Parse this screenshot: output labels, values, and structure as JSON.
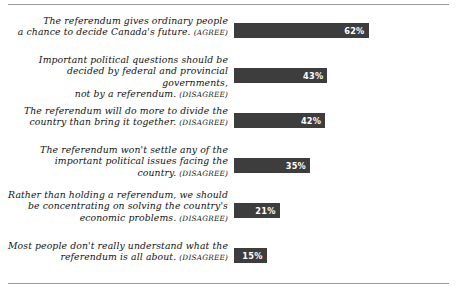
{
  "chart_data": {
    "type": "bar",
    "orientation": "horizontal",
    "title": "",
    "xlabel": "",
    "ylabel": "",
    "xlim": [
      0,
      100
    ],
    "grid": false,
    "legend": null,
    "value_suffix": "%",
    "categories": [
      "The referendum gives ordinary people a chance to decide Canada's future. (AGREE)",
      "Important political questions should be decided by federal and provincial governments, not by a referendum. (DISAGREE)",
      "The referendum will do more to divide the country than bring it together. (DISAGREE)",
      "The referendum won't settle any of the important political issues facing the country. (DISAGREE)",
      "Rather than holding a referendum, we should be concentrating on solving the country's economic problems. (DISAGREE)",
      "Most people don't really understand what the referendum is all about. (DISAGREE)"
    ],
    "values": [
      62,
      43,
      42,
      35,
      21,
      15
    ],
    "value_labels": [
      "62%",
      "43%",
      "42%",
      "35%",
      "21%",
      "15%"
    ],
    "bar_color": "#3d3d3d",
    "value_label_color": "#ffffff",
    "background_color": "#ffffff",
    "rule_color": "#9a9a9a"
  },
  "rows": [
    {
      "line1": "The referendum gives ordinary people",
      "line2": "a chance to decide Canada's future.",
      "line3": "",
      "tag": "(AGREE)",
      "value": "62%",
      "width_pct": 62
    },
    {
      "line1": "Important political questions should be",
      "line2": "decided by federal and provincial governments,",
      "line3": "not by a referendum.",
      "tag": "(DISAGREE)",
      "value": "43%",
      "width_pct": 43
    },
    {
      "line1": "The referendum will do more to divide the",
      "line2": "country than bring it together.",
      "line3": "",
      "tag": "(DISAGREE)",
      "value": "42%",
      "width_pct": 42
    },
    {
      "line1": "The referendum won't settle any of the",
      "line2": "important political issues facing the",
      "line3": "country.",
      "tag": "(DISAGREE)",
      "value": "35%",
      "width_pct": 35
    },
    {
      "line1": "Rather than holding a referendum, we should",
      "line2": "be concentrating on solving the country's",
      "line3": "economic problems.",
      "tag": "(DISAGREE)",
      "value": "21%",
      "width_pct": 21
    },
    {
      "line1": "Most people don't really understand what the",
      "line2": "referendum is all about.",
      "line3": "",
      "tag": "(DISAGREE)",
      "value": "15%",
      "width_pct": 15
    }
  ]
}
